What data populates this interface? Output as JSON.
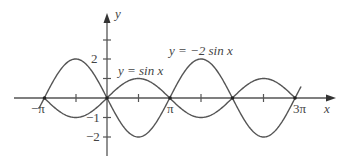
{
  "chart_data": {
    "type": "line",
    "title": "",
    "xlabel": "x",
    "ylabel": "y",
    "xlim": [
      -3.4,
      10.4
    ],
    "ylim": [
      -2.6,
      2.9
    ],
    "grid": false,
    "x_tick_labels": [
      "−π",
      "π",
      "3π"
    ],
    "x_ticks": [
      "-π",
      "-π/2",
      "0",
      "π/2",
      "π",
      "3π/2",
      "2π",
      "5π/2",
      "3π"
    ],
    "y_tick_labels": [
      "2",
      "1",
      "−1",
      "−2"
    ],
    "y_ticks": [
      -2,
      -1,
      1,
      2,
      3
    ],
    "series": [
      {
        "name": "y = sin x",
        "function": "sin(x)",
        "x_range": [
          "-π",
          "3π"
        ],
        "amplitude": 1,
        "points": [
          [
            -3.1416,
            0
          ],
          [
            -1.5708,
            -1
          ],
          [
            0,
            0
          ],
          [
            1.5708,
            1
          ],
          [
            3.1416,
            0
          ],
          [
            4.7124,
            -1
          ],
          [
            6.2832,
            0
          ],
          [
            7.854,
            1
          ],
          [
            9.4248,
            0
          ]
        ]
      },
      {
        "name": "y = −2 sin x",
        "function": "-2*sin(x)",
        "x_range": [
          "-π-0.3",
          "3π+0.3"
        ],
        "amplitude": 2,
        "points": [
          [
            -3.1416,
            0
          ],
          [
            -1.5708,
            2
          ],
          [
            0,
            0
          ],
          [
            1.5708,
            -2
          ],
          [
            3.1416,
            0
          ],
          [
            4.7124,
            2
          ],
          [
            6.2832,
            0
          ],
          [
            7.854,
            -2
          ],
          [
            9.4248,
            0
          ]
        ]
      }
    ],
    "annotations": [
      "y = sin x",
      "y = −2 sin x"
    ]
  },
  "labels": {
    "x_axis": "x",
    "y_axis": "y",
    "neg_pi": "−π",
    "pi": "π",
    "three_pi": "3π",
    "y2": "2",
    "y_1": "−1",
    "y_2": "−2",
    "sin_label": "y = sin x",
    "neg2sin_label": "y = −2 sin x"
  },
  "colors": {
    "curve": "#555555",
    "axis": "#555555",
    "text": "#444444"
  }
}
